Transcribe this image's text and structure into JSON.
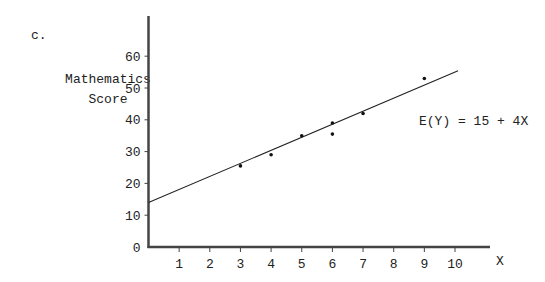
{
  "panel_label": "c.",
  "equation": "E(Y) = 15 + 4X",
  "chart_data": {
    "type": "scatter",
    "title": "",
    "panel": "c.",
    "xlabel": "X",
    "ylabel": "Mathematics Score",
    "ylabel_lines": [
      "Mathematics",
      "Score"
    ],
    "x_ticks": [
      1,
      2,
      3,
      4,
      5,
      6,
      7,
      8,
      9,
      10
    ],
    "y_ticks": [
      0,
      10,
      20,
      30,
      40,
      50,
      60
    ],
    "xlim": [
      0,
      11
    ],
    "ylim": [
      0,
      60
    ],
    "grid": false,
    "legend": null,
    "points": [
      {
        "x": 3,
        "y": 25.5
      },
      {
        "x": 4,
        "y": 29
      },
      {
        "x": 5,
        "y": 35
      },
      {
        "x": 6,
        "y": 39
      },
      {
        "x": 6,
        "y": 35.5
      },
      {
        "x": 7,
        "y": 42
      },
      {
        "x": 9,
        "y": 53
      }
    ],
    "regression_line": {
      "intercept": 14,
      "slope": 4.1,
      "x_range": [
        0,
        10.1
      ],
      "label": "E(Y) = 15 + 4X"
    },
    "annotations": [
      "E(Y) = 15 + 4X"
    ]
  }
}
